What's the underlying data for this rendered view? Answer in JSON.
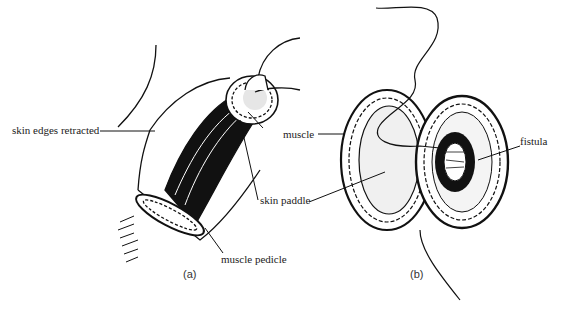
{
  "figure": {
    "panels": [
      {
        "id": "a",
        "caption": "(a)",
        "labels": {
          "skin_edges": "skin edges retracted",
          "muscle": "muscle",
          "skin_paddle": "skin paddle",
          "muscle_pedicle": "muscle pedicle"
        }
      },
      {
        "id": "b",
        "caption": "(b)",
        "labels": {
          "fistula": "fistula"
        }
      }
    ]
  }
}
